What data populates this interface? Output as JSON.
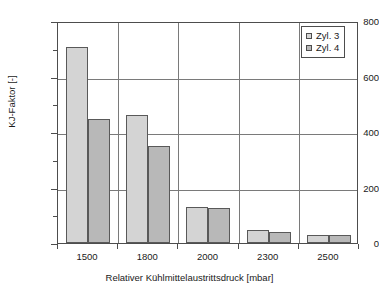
{
  "chart_data": {
    "type": "bar",
    "title": "",
    "xlabel": "Relativer Kühlmittelaustrittsdruck [mbar]",
    "ylabel": "KJ-Faktor [-]",
    "categories": [
      "1500",
      "1800",
      "2000",
      "2300",
      "2500"
    ],
    "series": [
      {
        "name": "Zyl. 3",
        "color": "#d4d4d4",
        "values": [
          705,
          462,
          131,
          48,
          28
        ]
      },
      {
        "name": "Zyl. 4",
        "color": "#b8b8b8",
        "values": [
          447,
          348,
          127,
          38,
          30
        ]
      }
    ],
    "ylim": [
      0,
      800
    ],
    "ytick_labels": [
      "800",
      "600",
      "400",
      "200",
      "0"
    ],
    "ytick_values": [
      800,
      600,
      400,
      200,
      0
    ],
    "yminor_values": [
      700,
      500,
      300,
      100
    ],
    "grid": "horizontal-and-category-dividers",
    "legend_position": "top-right"
  },
  "legend": {
    "entries": [
      {
        "label": "Zyl. 3"
      },
      {
        "label": "Zyl. 4"
      }
    ]
  }
}
